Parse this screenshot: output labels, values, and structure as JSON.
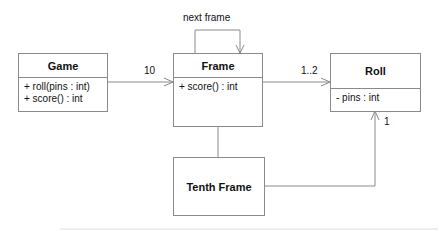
{
  "diagram": {
    "type": "uml-class-diagram",
    "classes": [
      {
        "id": "game",
        "name": "Game",
        "members": [
          "+ roll(pins : int)",
          "+ score() : int"
        ]
      },
      {
        "id": "frame",
        "name": "Frame",
        "members": [
          "+ score() : int"
        ]
      },
      {
        "id": "roll",
        "name": "Roll",
        "members": [
          "- pins : int"
        ]
      },
      {
        "id": "tenth",
        "name": "Tenth Frame",
        "members": []
      }
    ],
    "relations": [
      {
        "from": "game",
        "to": "frame",
        "kind": "association",
        "multiplicity": "10"
      },
      {
        "from": "frame",
        "to": "frame",
        "kind": "association",
        "label": "next frame"
      },
      {
        "from": "frame",
        "to": "roll",
        "kind": "association",
        "multiplicity": "1..2"
      },
      {
        "from": "tenth",
        "to": "frame",
        "kind": "generalization"
      },
      {
        "from": "tenth",
        "to": "roll",
        "kind": "association",
        "multiplicity": "1"
      }
    ],
    "colors": {
      "line": "#8a8a8a",
      "text": "#111111",
      "background": "#ffffff"
    }
  }
}
